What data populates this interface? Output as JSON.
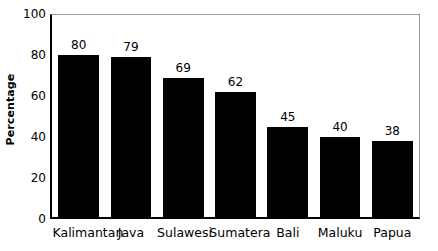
{
  "chart_data": {
    "type": "bar",
    "title": "",
    "xlabel": "",
    "ylabel": "Percentage",
    "categories": [
      "Kalimantan",
      "Java",
      "Sulawesi",
      "Sumatera",
      "Bali",
      "Maluku",
      "Papua"
    ],
    "values": [
      80,
      79,
      69,
      62,
      45,
      40,
      38
    ],
    "value_labels": [
      "80",
      "79",
      "69",
      "62",
      "45",
      "40",
      "38"
    ],
    "ylim": [
      0,
      100
    ],
    "y_ticks": [
      0,
      20,
      40,
      60,
      80,
      100
    ],
    "y_tick_labels": [
      "0",
      "20",
      "40",
      "60",
      "80",
      "100"
    ],
    "grid": false,
    "legend": null,
    "bar_color": "#000000",
    "background_color": "#ffffff",
    "axis_color": "#000000",
    "frame_color": "#9a9a9a"
  }
}
